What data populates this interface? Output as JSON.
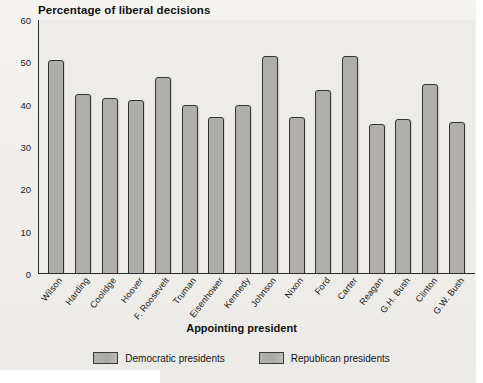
{
  "chart_data": {
    "type": "bar",
    "title": "Percentage of liberal decisions",
    "xlabel": "Appointing president",
    "ylabel": "Percentage of liberal decisions",
    "ylim": [
      0,
      60
    ],
    "yticks": [
      60,
      50,
      40,
      30,
      20,
      10,
      0
    ],
    "grid": false,
    "legend_position": "bottom-center",
    "categories": [
      "Wilson",
      "Harding",
      "Coolidge",
      "Hoover",
      "F. Roosevelt",
      "Truman",
      "Eisenhower",
      "Kennedy",
      "Johnson",
      "Nixon",
      "Ford",
      "Carter",
      "Reagan",
      "G.H. Bush",
      "Clinton",
      "G.W. Bush"
    ],
    "values": [
      50.5,
      42.5,
      41.5,
      41.0,
      46.5,
      40.0,
      37.0,
      40.0,
      51.5,
      37.0,
      43.5,
      51.5,
      35.5,
      36.5,
      45.0,
      36.0
    ],
    "party": [
      "Democratic",
      "Republican",
      "Republican",
      "Republican",
      "Democratic",
      "Democratic",
      "Republican",
      "Democratic",
      "Democratic",
      "Republican",
      "Republican",
      "Democratic",
      "Republican",
      "Republican",
      "Democratic",
      "Republican"
    ],
    "series": [
      {
        "name": "Democratic presidents",
        "color": "#b0aeab"
      },
      {
        "name": "Republican presidents",
        "color": "#b0aeab"
      }
    ],
    "legend": [
      "Democratic presidents",
      "Republican presidents"
    ]
  },
  "colors": {
    "bar_fill": "#b0aeab",
    "bar_stroke": "#343434",
    "plot_background": "#eeece8",
    "page_background": "#f2f1ee",
    "text": "#141414"
  }
}
